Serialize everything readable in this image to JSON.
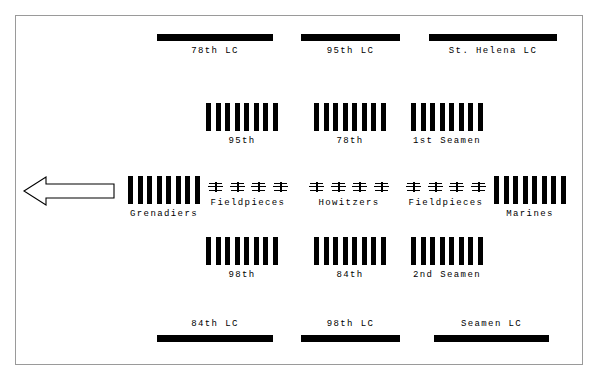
{
  "diagram": {
    "direction_arrow": {
      "icon": "left-arrow-icon",
      "points": "left",
      "meaning": "direction of advance"
    },
    "rows": [
      {
        "row_name": "top-light-companies",
        "symbol": "solid-bar",
        "label_position": "below",
        "units": [
          {
            "label": "78th LC"
          },
          {
            "label": "95th LC"
          },
          {
            "label": "St. Helena LC"
          }
        ]
      },
      {
        "row_name": "first-infantry-line",
        "symbol": "infantry-block",
        "label_position": "below",
        "staves": 8,
        "units": [
          {
            "label": "95th"
          },
          {
            "label": "78th"
          },
          {
            "label": "1st Seamen"
          }
        ]
      },
      {
        "row_name": "center-line",
        "label_position": "below",
        "units": [
          {
            "label": "Grenadiers",
            "symbol": "infantry-block",
            "staves": 8
          },
          {
            "label": "Fieldpieces",
            "symbol": "artillery-guns",
            "guns": 4
          },
          {
            "label": "Howitzers",
            "symbol": "artillery-guns",
            "guns": 4
          },
          {
            "label": "Fieldpieces",
            "symbol": "artillery-guns",
            "guns": 4
          },
          {
            "label": "Marines",
            "symbol": "infantry-block",
            "staves": 8
          }
        ]
      },
      {
        "row_name": "second-infantry-line",
        "symbol": "infantry-block",
        "label_position": "below",
        "staves": 8,
        "units": [
          {
            "label": "98th"
          },
          {
            "label": "84th"
          },
          {
            "label": "2nd Seamen"
          }
        ]
      },
      {
        "row_name": "bottom-light-companies",
        "symbol": "solid-bar",
        "label_position": "above",
        "units": [
          {
            "label": "84th LC"
          },
          {
            "label": "98th LC"
          },
          {
            "label": "Seamen LC"
          }
        ]
      }
    ],
    "colors": {
      "unit_fill": "#000000",
      "background": "#ffffff",
      "border": "#9a9a9a"
    }
  }
}
